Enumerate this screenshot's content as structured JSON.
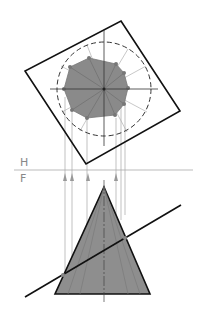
{
  "diagram": {
    "type": "descriptive-geometry",
    "fold_line": {
      "upper_label": "H",
      "lower_label": "F"
    },
    "colors": {
      "outline": "#111111",
      "fill": "#8a8a8a",
      "construction": "#9a9a9a",
      "dashed_circle": "#333333"
    },
    "top_view": {
      "square_corners": [
        [
          121,
          21
        ],
        [
          180,
          111
        ],
        [
          86,
          164
        ],
        [
          25,
          71
        ]
      ],
      "circle_center": [
        104,
        89
      ],
      "circle_radius": 47,
      "section_points": 10
    },
    "front_view": {
      "apex": [
        104,
        187
      ],
      "base_left": [
        55,
        294
      ],
      "base_right": [
        150,
        294
      ],
      "cutting_line": [
        [
          25,
          297
        ],
        [
          181,
          205
        ]
      ]
    }
  }
}
